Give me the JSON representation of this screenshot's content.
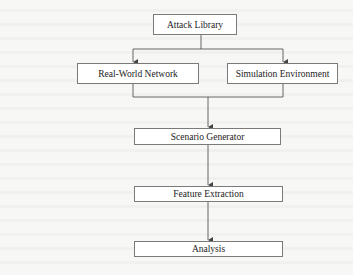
{
  "diagram": {
    "type": "flowchart",
    "nodes": {
      "attack_library": "Attack Library",
      "real_world_network": "Real-World Network",
      "simulation_environment": "Simulation Environment",
      "scenario_generator": "Scenario Generator",
      "feature_extraction": "Feature Extraction",
      "analysis": "Analysis"
    },
    "edges": [
      {
        "from": "Attack Library",
        "to": "Real-World Network"
      },
      {
        "from": "Attack Library",
        "to": "Simulation Environment"
      },
      {
        "from": "Real-World Network",
        "to": "Scenario Generator"
      },
      {
        "from": "Simulation Environment",
        "to": "Scenario Generator"
      },
      {
        "from": "Scenario Generator",
        "to": "Feature Extraction"
      },
      {
        "from": "Feature Extraction",
        "to": "Analysis"
      }
    ],
    "colors": {
      "line": "#555555",
      "box_border": "#7a7a7a",
      "box_fill": "#ffffff",
      "text": "#222222",
      "background": "#f7f7f5"
    }
  }
}
